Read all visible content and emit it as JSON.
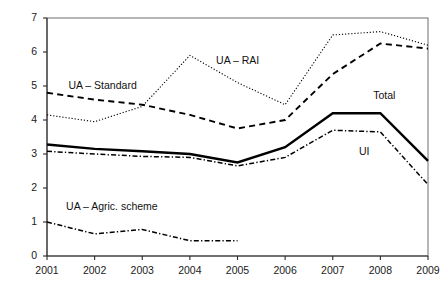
{
  "chart_data": {
    "type": "line",
    "title": "",
    "subtitle": "",
    "xlabel": "",
    "ylabel": "",
    "x": [
      2001,
      2002,
      2003,
      2004,
      2005,
      2006,
      2007,
      2008,
      2009
    ],
    "categories": [
      "2001",
      "2002",
      "2003",
      "2004",
      "2005",
      "2006",
      "2007",
      "2008",
      "2009"
    ],
    "xlim": [
      2001,
      2009
    ],
    "ylim": [
      0,
      7
    ],
    "ytick_labels": [
      "7",
      "6",
      "5",
      "4",
      "3",
      "2",
      "1",
      "0"
    ],
    "ytick_values": [
      7,
      6,
      5,
      4,
      3,
      2,
      1,
      0
    ],
    "grid": false,
    "legend_position": "inline-annotations",
    "series": [
      {
        "name": "UA – RAI",
        "label": "UA – RAI",
        "style": "dotted",
        "color": "#000000",
        "width": 1.1,
        "x": [
          2001,
          2002,
          2003,
          2004,
          2005,
          2006,
          2007,
          2008,
          2009
        ],
        "values": [
          4.15,
          3.95,
          4.4,
          5.9,
          5.1,
          4.45,
          6.5,
          6.6,
          6.2
        ]
      },
      {
        "name": "UA – Standard",
        "label": "UA – Standard",
        "style": "dashed",
        "color": "#000000",
        "width": 1.9,
        "x": [
          2001,
          2002,
          2003,
          2004,
          2005,
          2006,
          2007,
          2008,
          2009
        ],
        "values": [
          4.8,
          4.6,
          4.45,
          4.15,
          3.75,
          4.0,
          5.35,
          6.25,
          6.1
        ]
      },
      {
        "name": "Total",
        "label": "Total",
        "style": "solid",
        "color": "#000000",
        "width": 2.4,
        "x": [
          2001,
          2002,
          2003,
          2004,
          2005,
          2006,
          2007,
          2008,
          2009
        ],
        "values": [
          3.28,
          3.15,
          3.08,
          3.0,
          2.75,
          3.2,
          4.2,
          4.2,
          2.8
        ]
      },
      {
        "name": "UI",
        "label": "UI",
        "style": "dash-dot",
        "color": "#000000",
        "width": 1.5,
        "x": [
          2001,
          2002,
          2003,
          2004,
          2005,
          2006,
          2007,
          2008,
          2009
        ],
        "values": [
          3.08,
          3.0,
          2.93,
          2.9,
          2.65,
          2.9,
          3.7,
          3.65,
          2.1
        ]
      },
      {
        "name": "UA – Agric. scheme",
        "label": "UA – Agric. scheme",
        "style": "dash-dot",
        "color": "#000000",
        "width": 1.5,
        "x": [
          2001,
          2002,
          2003,
          2004,
          2005
        ],
        "values": [
          1.0,
          0.65,
          0.78,
          0.45,
          0.45
        ]
      }
    ],
    "annotations": [
      {
        "text": "UA – Standard",
        "x": 2001.45,
        "y": 5.0,
        "anchor": "start"
      },
      {
        "text": "UA – RAI",
        "x": 2004.55,
        "y": 5.73,
        "anchor": "start"
      },
      {
        "text": "Total",
        "x": 2007.85,
        "y": 4.72,
        "anchor": "start"
      },
      {
        "text": "UI",
        "x": 2007.55,
        "y": 3.05,
        "anchor": "start"
      },
      {
        "text": "UA – Agric. scheme",
        "x": 2001.4,
        "y": 1.43,
        "anchor": "start"
      }
    ]
  }
}
